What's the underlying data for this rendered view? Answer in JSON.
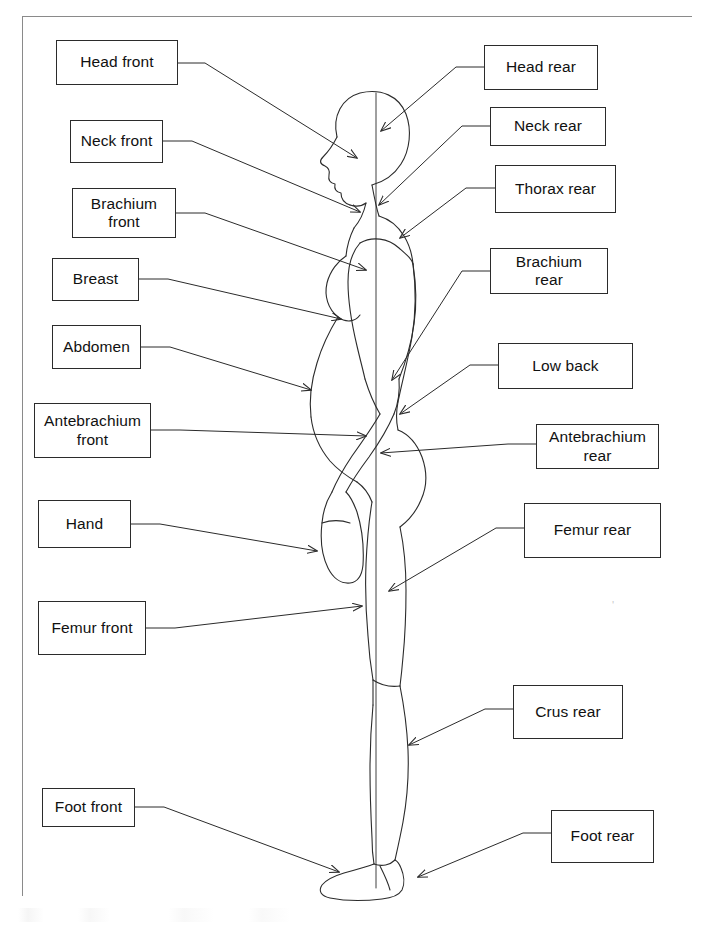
{
  "diagram": {
    "figure_name": "human-body-lateral-silhouette",
    "line_color": "#2b2b2b",
    "frame_color": "#8a8a8a",
    "background_color": "#ffffff"
  },
  "labels": {
    "left": [
      {
        "id": "head-front",
        "text": "Head front",
        "x": 56,
        "y": 40,
        "w": 122,
        "h": 45
      },
      {
        "id": "neck-front",
        "text": "Neck front",
        "x": 70,
        "y": 120,
        "w": 93,
        "h": 43
      },
      {
        "id": "brachium-front",
        "text": "Brachium\nfront",
        "x": 72,
        "y": 188,
        "w": 104,
        "h": 50
      },
      {
        "id": "breast",
        "text": "Breast",
        "x": 52,
        "y": 258,
        "w": 87,
        "h": 43
      },
      {
        "id": "abdomen",
        "text": "Abdomen",
        "x": 52,
        "y": 325,
        "w": 89,
        "h": 44
      },
      {
        "id": "antebrachium-front",
        "text": "Antebrachium\nfront",
        "x": 34,
        "y": 403,
        "w": 117,
        "h": 55
      },
      {
        "id": "hand",
        "text": "Hand",
        "x": 38,
        "y": 500,
        "w": 93,
        "h": 48
      },
      {
        "id": "femur-front",
        "text": "Femur front",
        "x": 38,
        "y": 601,
        "w": 108,
        "h": 54
      },
      {
        "id": "foot-front",
        "text": "Foot front",
        "x": 42,
        "y": 788,
        "w": 93,
        "h": 39
      }
    ],
    "right": [
      {
        "id": "head-rear",
        "text": "Head rear",
        "x": 484,
        "y": 45,
        "w": 114,
        "h": 45
      },
      {
        "id": "neck-rear",
        "text": "Neck rear",
        "x": 490,
        "y": 107,
        "w": 116,
        "h": 39
      },
      {
        "id": "thorax-rear",
        "text": "Thorax rear",
        "x": 495,
        "y": 165,
        "w": 121,
        "h": 48
      },
      {
        "id": "brachium-rear",
        "text": "Brachium\nrear",
        "x": 490,
        "y": 248,
        "w": 118,
        "h": 46
      },
      {
        "id": "low-back",
        "text": "Low back",
        "x": 498,
        "y": 343,
        "w": 135,
        "h": 46
      },
      {
        "id": "antebrachium-rear",
        "text": "Antebrachium\nrear",
        "x": 536,
        "y": 424,
        "w": 123,
        "h": 45
      },
      {
        "id": "femur-rear",
        "text": "Femur rear",
        "x": 524,
        "y": 503,
        "w": 137,
        "h": 55
      },
      {
        "id": "crus-rear",
        "text": "Crus rear",
        "x": 513,
        "y": 685,
        "w": 110,
        "h": 54
      },
      {
        "id": "foot-rear",
        "text": "Foot rear",
        "x": 551,
        "y": 810,
        "w": 103,
        "h": 53
      }
    ]
  },
  "leaders": {
    "description": "Elbow-style leader lines from each label box to an arrowhead on the body figure.",
    "left": [
      {
        "id": "leader-head-front",
        "from": "head-front",
        "path": "M178,63 L205,63 L357,158",
        "tip": [
          357,
          158
        ],
        "angle": 32
      },
      {
        "id": "leader-neck-front",
        "from": "neck-front",
        "path": "M163,141 L192,141 L360,212",
        "tip": [
          360,
          212
        ],
        "angle": 23
      },
      {
        "id": "leader-brachium-front",
        "from": "brachium-front",
        "path": "M176,213 L205,213 L366,270",
        "tip": [
          366,
          270
        ],
        "angle": 19
      },
      {
        "id": "leader-breast",
        "from": "breast",
        "path": "M139,279 L168,279 L341,319",
        "tip": [
          341,
          319
        ],
        "angle": 13
      },
      {
        "id": "leader-abdomen",
        "from": "abdomen",
        "path": "M141,347 L170,347 L311,390",
        "tip": [
          311,
          390
        ],
        "angle": 17
      },
      {
        "id": "leader-antebrachium-front",
        "from": "antebrachium-front",
        "path": "M151,430 L180,430 L366,436",
        "tip": [
          366,
          436
        ],
        "angle": 2
      },
      {
        "id": "leader-hand",
        "from": "hand",
        "path": "M131,524 L160,524 L317,551",
        "tip": [
          317,
          551
        ],
        "angle": 10
      },
      {
        "id": "leader-femur-front",
        "from": "femur-front",
        "path": "M146,628 L175,628 L362,606",
        "tip": [
          362,
          606
        ],
        "angle": -7
      },
      {
        "id": "leader-foot-front",
        "from": "foot-front",
        "path": "M135,807 L164,807 L339,872",
        "tip": [
          339,
          872
        ],
        "angle": 20
      }
    ],
    "right": [
      {
        "id": "leader-head-rear",
        "from": "head-rear",
        "path": "M484,67 L456,67 L381,131",
        "tip": [
          381,
          131
        ],
        "angle": 220
      },
      {
        "id": "leader-neck-rear",
        "from": "neck-rear",
        "path": "M490,126 L462,126 L379,205",
        "tip": [
          379,
          205
        ],
        "angle": 224
      },
      {
        "id": "leader-thorax-rear",
        "from": "thorax-rear",
        "path": "M495,188 L466,188 L400,238",
        "tip": [
          400,
          238
        ],
        "angle": 217
      },
      {
        "id": "leader-brachium-rear",
        "from": "brachium-rear",
        "path": "M490,271 L462,271 L392,380",
        "tip": [
          392,
          380
        ],
        "angle": 237
      },
      {
        "id": "leader-low-back",
        "from": "low-back",
        "path": "M498,365 L470,365 L400,414",
        "tip": [
          400,
          414
        ],
        "angle": 215
      },
      {
        "id": "leader-antebrachium-rear",
        "from": "antebrachium-rear",
        "path": "M536,444 L508,444 L381,453",
        "tip": [
          381,
          453
        ],
        "angle": 184
      },
      {
        "id": "leader-femur-rear",
        "from": "femur-rear",
        "path": "M524,528 L496,528 L389,591",
        "tip": [
          389,
          591
        ],
        "angle": 210
      },
      {
        "id": "leader-crus-rear",
        "from": "crus-rear",
        "path": "M513,709 L485,709 L409,745",
        "tip": [
          409,
          745
        ],
        "angle": 205
      },
      {
        "id": "leader-foot-rear",
        "from": "foot-rear",
        "path": "M551,833 L523,833 L418,877",
        "tip": [
          418,
          877
        ],
        "angle": 203
      }
    ]
  },
  "figure": {
    "midline": {
      "id": "body-midline",
      "x": 376,
      "top": 93,
      "bottom": 888
    },
    "parts": [
      "head",
      "face-profile",
      "neck",
      "shoulder",
      "thorax",
      "breast",
      "abdomen",
      "low-back",
      "buttock",
      "arm",
      "forearm",
      "hand",
      "thigh",
      "knee",
      "crus",
      "foot"
    ]
  }
}
